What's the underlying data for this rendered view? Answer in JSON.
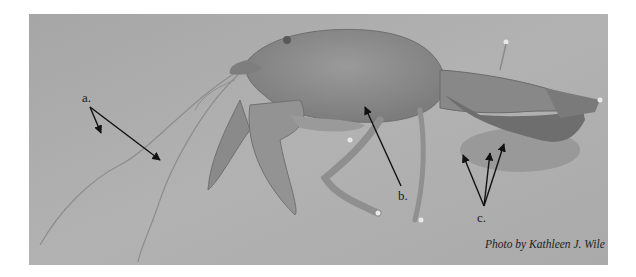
{
  "figure": {
    "labels": [
      {
        "id": "a",
        "text": "a.",
        "x": 82,
        "y": 91
      },
      {
        "id": "b",
        "text": "b.",
        "x": 398,
        "y": 189
      },
      {
        "id": "c",
        "text": "c.",
        "x": 477,
        "y": 211
      }
    ],
    "credit": "Photo by Kathleen J. Wile",
    "colors": {
      "background": "#a9a9a9",
      "body": "#8e8e8e",
      "body_dark": "#6e6e6e",
      "arrow": "#111111"
    }
  }
}
